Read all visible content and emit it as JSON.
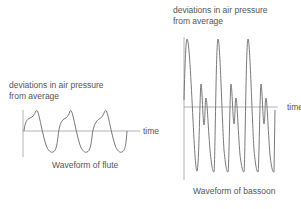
{
  "flute": {
    "ylabel_line1": "deviations in air pressure",
    "ylabel_line2": "from average",
    "xlabel": "time",
    "caption": "Waveform of flute"
  },
  "bassoon": {
    "ylabel_line1": "deviations in air pressure",
    "ylabel_line2": "from average",
    "xlabel": "time",
    "caption": "Waveform of bassoon"
  },
  "colors": {
    "wave": "#7a7a7a",
    "axis": "#9a9a9a",
    "text": "#555555"
  }
}
